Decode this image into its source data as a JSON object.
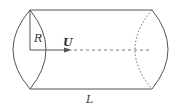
{
  "diagram": {
    "type": "cylinder-flow",
    "labels": {
      "radius": "R",
      "velocity": "U",
      "length": "L"
    },
    "colors": {
      "stroke": "#555555",
      "text": "#333333",
      "background": "#ffffff"
    }
  }
}
